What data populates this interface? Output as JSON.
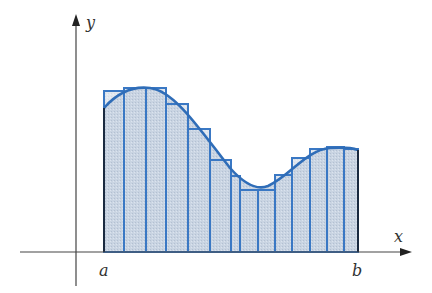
{
  "figure": {
    "type": "riemann-sum-diagram",
    "labels": {
      "y_axis": "y",
      "x_axis": "x",
      "a": "a",
      "b": "b"
    },
    "colors": {
      "curve": "#2f6db8",
      "rect_stroke": "#3a78c4",
      "rect_fill": "#c9d4e2",
      "axis": "#444444",
      "edge_dark": "#1a2a40"
    },
    "axes": {
      "origin_x": 76,
      "baseline_y": 252,
      "y_axis_top": 14,
      "y_axis_bottom": 286,
      "x_axis_left": 20,
      "x_axis_right": 412
    },
    "rectangles": [
      {
        "x0": 104,
        "x1": 124,
        "top": 91
      },
      {
        "x0": 124,
        "x1": 146,
        "top": 88
      },
      {
        "x0": 146,
        "x1": 166,
        "top": 88
      },
      {
        "x0": 166,
        "x1": 188,
        "top": 104
      },
      {
        "x0": 188,
        "x1": 210,
        "top": 129
      },
      {
        "x0": 210,
        "x1": 231,
        "top": 160
      },
      {
        "x0": 231,
        "x1": 240,
        "top": 176
      },
      {
        "x0": 240,
        "x1": 258,
        "top": 190
      },
      {
        "x0": 258,
        "x1": 275,
        "top": 190
      },
      {
        "x0": 275,
        "x1": 292,
        "top": 175
      },
      {
        "x0": 292,
        "x1": 310,
        "top": 158
      },
      {
        "x0": 310,
        "x1": 327,
        "top": 149
      },
      {
        "x0": 327,
        "x1": 344,
        "top": 147
      },
      {
        "x0": 344,
        "x1": 358,
        "top": 149
      }
    ],
    "curve_path": "M104,108 C118,92 134,86 150,88 C175,91 200,130 230,168 C246,186 258,190 268,186 C290,176 306,150 330,148 C345,147 352,148 358,150"
  }
}
